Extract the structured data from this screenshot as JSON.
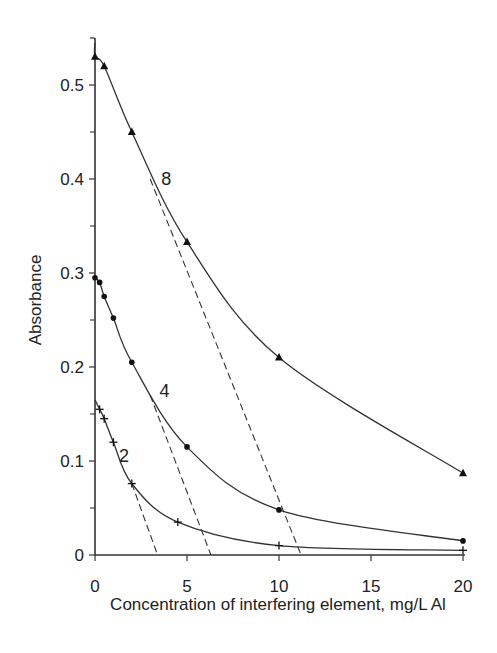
{
  "chart_data": {
    "type": "line",
    "title": "",
    "xlabel": "Concentration of interfering element, mg/L Al",
    "ylabel": "Absorbance",
    "xlim": [
      0,
      20
    ],
    "ylim": [
      0,
      0.55
    ],
    "xticks": [
      0,
      5,
      10,
      15,
      20
    ],
    "xtick_labels": [
      "0",
      "5",
      "10",
      "15",
      "20"
    ],
    "yticks": [
      0,
      0.1,
      0.2,
      0.3,
      0.4,
      0.5
    ],
    "ytick_labels": [
      "0",
      "0.1",
      "0.2",
      "0.3",
      "0.4",
      "0.5"
    ],
    "y_minor_ticks": [
      0.05,
      0.15,
      0.25,
      0.35,
      0.45
    ],
    "grid": false,
    "legend": "none (curves labelled inline)",
    "series": [
      {
        "name": "8",
        "marker": "triangle",
        "x": [
          0,
          0.5,
          2,
          5,
          10,
          20
        ],
        "y": [
          0.53,
          0.52,
          0.45,
          0.333,
          0.21,
          0.087
        ],
        "curve_start": [
          0,
          0.545
        ],
        "label_pos": [
          3.6,
          0.4
        ]
      },
      {
        "name": "4",
        "marker": "dot",
        "x": [
          0,
          0.25,
          0.5,
          1,
          2,
          5,
          10,
          20
        ],
        "y": [
          0.295,
          0.29,
          0.275,
          0.252,
          0.205,
          0.115,
          0.048,
          0.015
        ],
        "curve_start": [
          0,
          0.297
        ],
        "label_pos": [
          3.5,
          0.175
        ]
      },
      {
        "name": "2",
        "marker": "plus",
        "x": [
          0.25,
          0.5,
          1,
          2,
          4.5,
          10,
          20
        ],
        "y": [
          0.155,
          0.145,
          0.12,
          0.076,
          0.035,
          0.01,
          0.005
        ],
        "curve_start": [
          0,
          0.165
        ],
        "label_pos": [
          1.3,
          0.105
        ]
      }
    ],
    "tangent_lines": [
      {
        "series": "8",
        "style": "dashed",
        "from": [
          3.0,
          0.4
        ],
        "to": [
          11.2,
          0
        ]
      },
      {
        "series": "4",
        "style": "dashed",
        "from": [
          3.0,
          0.17
        ],
        "to": [
          6.3,
          0
        ]
      },
      {
        "series": "2",
        "style": "dashed",
        "from": [
          2.0,
          0.076
        ],
        "to": [
          3.4,
          0
        ]
      }
    ]
  },
  "colors": {
    "line": "#333333",
    "text": "#222222",
    "background": "#ffffff"
  }
}
